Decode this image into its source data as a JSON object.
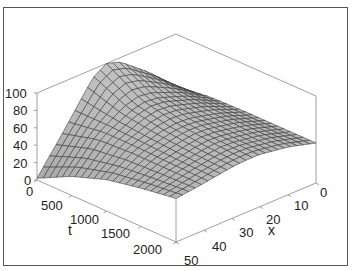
{
  "chart_data": {
    "type": "surface3d",
    "title": "",
    "axes": {
      "t": {
        "label": "t",
        "ticks": [
          0,
          500,
          1000,
          1500,
          2000
        ],
        "range": [
          0,
          2000
        ]
      },
      "x": {
        "label": "x",
        "ticks": [
          0,
          10,
          20,
          30,
          40,
          50
        ],
        "range": [
          0,
          50
        ]
      },
      "z": {
        "label": "",
        "ticks": [
          0,
          20,
          40,
          60,
          80,
          100
        ],
        "range": [
          0,
          100
        ]
      }
    },
    "sample_values": {
      "t": [
        0,
        500,
        1000,
        1500,
        2000
      ],
      "x": [
        0,
        10,
        20,
        25,
        30,
        40,
        50
      ],
      "z": [
        [
          40,
          70,
          95,
          100,
          90,
          45,
          2
        ],
        [
          45,
          62,
          74,
          76,
          72,
          55,
          22
        ],
        [
          46,
          58,
          66,
          67,
          65,
          56,
          36
        ],
        [
          46,
          56,
          62,
          63,
          61,
          55,
          44
        ],
        [
          46,
          55,
          60,
          60,
          59,
          54,
          50
        ]
      ]
    },
    "grid": false,
    "box": true,
    "surface_color": "#b8b8b8",
    "mesh_color": "#333333"
  },
  "labels": {
    "t_axis": "t",
    "x_axis": "x",
    "z_ticks": [
      "0",
      "20",
      "40",
      "60",
      "80",
      "100"
    ],
    "t_ticks": [
      "0",
      "500",
      "1000",
      "1500",
      "2000"
    ],
    "x_ticks": [
      "0",
      "10",
      "20",
      "30",
      "40",
      "50"
    ]
  }
}
